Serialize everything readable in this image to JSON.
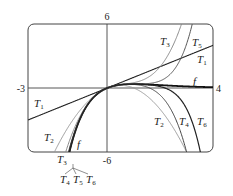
{
  "chart_data": {
    "type": "line",
    "title": "",
    "function": "f(x) = x e^(-x)",
    "xlabel": "",
    "ylabel": "",
    "xlim": [
      -3,
      4
    ],
    "ylim": [
      -6,
      6
    ],
    "grid": false,
    "legend": "inline labels",
    "tick_labels": {
      "x_min": "-3",
      "x_max": "4",
      "y_max": "6",
      "y_min": "-6"
    },
    "series": [
      {
        "name": "f",
        "label": "f",
        "coeffs": [
          0,
          1,
          -1,
          0.5,
          -0.1666667,
          0.0416667,
          -0.0083333
        ],
        "exact": true,
        "color": "#111111",
        "width": 1.8
      },
      {
        "name": "T1",
        "label": "T",
        "sub": "1",
        "coeffs": [
          0,
          1
        ],
        "color": "#222222",
        "width": 1.1
      },
      {
        "name": "T2",
        "label": "T",
        "sub": "2",
        "coeffs": [
          0,
          1,
          -1
        ],
        "color": "#9a9a9a",
        "width": 1.0
      },
      {
        "name": "T3",
        "label": "T",
        "sub": "3",
        "coeffs": [
          0,
          1,
          -1,
          0.5
        ],
        "color": "#8a8a8a",
        "width": 1.0
      },
      {
        "name": "T4",
        "label": "T",
        "sub": "4",
        "coeffs": [
          0,
          1,
          -1,
          0.5,
          -0.1666667
        ],
        "color": "#444444",
        "width": 1.0
      },
      {
        "name": "T5",
        "label": "T",
        "sub": "5",
        "coeffs": [
          0,
          1,
          -1,
          0.5,
          -0.1666667,
          0.0416667
        ],
        "color": "#555555",
        "width": 1.0
      },
      {
        "name": "T6",
        "label": "T",
        "sub": "6",
        "coeffs": [
          0,
          1,
          -1,
          0.5,
          -0.1666667,
          0.0416667,
          -0.0083333
        ],
        "color": "#222222",
        "width": 1.2
      }
    ],
    "annotations": [
      {
        "text": "T",
        "sub": "3",
        "x_px": 160,
        "y_px": 45
      },
      {
        "text": "T",
        "sub": "5",
        "x_px": 192,
        "y_px": 46
      },
      {
        "text": "T",
        "sub": "1",
        "x_px": 197,
        "y_px": 63
      },
      {
        "text": "f",
        "sub": "",
        "x_px": 193,
        "y_px": 85
      },
      {
        "text": "T",
        "sub": "1",
        "x_px": 34,
        "y_px": 107
      },
      {
        "text": "T",
        "sub": "2",
        "x_px": 44,
        "y_px": 141
      },
      {
        "text": "f",
        "sub": "",
        "x_px": 77,
        "y_px": 148
      },
      {
        "text": "T",
        "sub": "2",
        "x_px": 154,
        "y_px": 125
      },
      {
        "text": "T",
        "sub": "4",
        "x_px": 179,
        "y_px": 125
      },
      {
        "text": "T",
        "sub": "6",
        "x_px": 197,
        "y_px": 125
      },
      {
        "text": "T",
        "sub": "3",
        "x_px": 57,
        "y_px": 163
      },
      {
        "text": "T",
        "sub": "4",
        "x_px": 60,
        "y_px": 183
      },
      {
        "text": "T",
        "sub": "5",
        "x_px": 73,
        "y_px": 183
      },
      {
        "text": "T",
        "sub": "6",
        "x_px": 86,
        "y_px": 183
      }
    ]
  }
}
